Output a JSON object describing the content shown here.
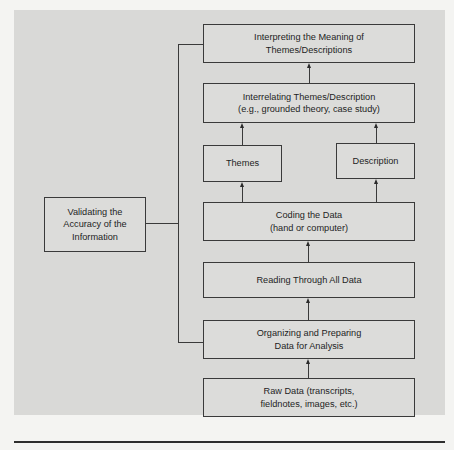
{
  "diagram": {
    "type": "flowchart",
    "direction": "bottom-to-top",
    "nodes": {
      "interpreting": {
        "label": "Interpreting the Meaning of\nThemes/Descriptions"
      },
      "interrelating": {
        "label": "Interrelating Themes/Description\n(e.g., grounded theory, case study)"
      },
      "themes": {
        "label": "Themes"
      },
      "description": {
        "label": "Description"
      },
      "coding": {
        "label": "Coding the Data\n(hand or computer)"
      },
      "reading": {
        "label": "Reading Through All Data"
      },
      "organizing": {
        "label": "Organizing and Preparing\nData for Analysis"
      },
      "raw_data": {
        "label": "Raw Data (transcripts,\nfieldnotes, images, etc.)"
      },
      "validating": {
        "label": "Validating the\nAccuracy of the\nInformation"
      }
    },
    "edges": [
      {
        "from": "raw_data",
        "to": "organizing",
        "arrow": true
      },
      {
        "from": "organizing",
        "to": "reading",
        "arrow": true
      },
      {
        "from": "reading",
        "to": "coding",
        "arrow": true
      },
      {
        "from": "coding",
        "to": "themes",
        "arrow": true
      },
      {
        "from": "coding",
        "to": "description",
        "arrow": true
      },
      {
        "from": "themes",
        "to": "interrelating",
        "arrow": true
      },
      {
        "from": "description",
        "to": "interrelating",
        "arrow": true
      },
      {
        "from": "interrelating",
        "to": "interpreting",
        "arrow": true
      },
      {
        "from": "validating",
        "to": [
          "interpreting",
          "organizing"
        ],
        "arrow": false,
        "style": "bracket"
      }
    ],
    "colors": {
      "panel": "#d9d9d7",
      "box_fill": "#dcdcda",
      "stroke": "#3a3a3a",
      "page": "#f4f4f2"
    }
  }
}
